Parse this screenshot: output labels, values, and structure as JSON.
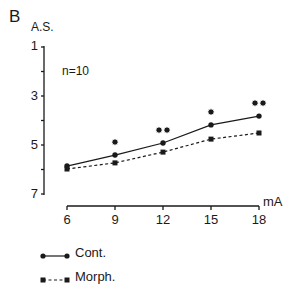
{
  "panel_label": "B",
  "chart_data": {
    "type": "line",
    "title": "",
    "xlabel": "mA",
    "ylabel": "A.S.",
    "annotation": "n=10",
    "x": [
      6,
      9,
      12,
      15,
      18
    ],
    "xticks": [
      "6",
      "9",
      "12",
      "15",
      "18"
    ],
    "yticks": [
      "1",
      "3",
      "5",
      "7"
    ],
    "ylim": [
      7,
      1
    ],
    "y_inverted": true,
    "grid": false,
    "legend_position": "bottom-left",
    "series": [
      {
        "name": "Cont.",
        "marker": "circle",
        "line": "solid",
        "values": [
          5.86,
          5.41,
          4.92,
          4.18,
          3.82
        ]
      },
      {
        "name": "Morph.",
        "marker": "square",
        "line": "dashed",
        "values": [
          5.98,
          5.73,
          5.29,
          4.76,
          4.51
        ]
      }
    ],
    "significance": [
      "",
      "*",
      "**",
      "*",
      "**"
    ]
  },
  "legend": {
    "items": [
      {
        "label": "Cont."
      },
      {
        "label": "Morph."
      }
    ]
  }
}
